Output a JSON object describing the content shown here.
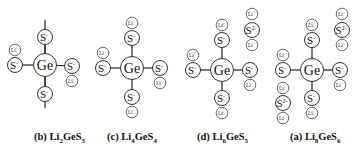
{
  "figure": {
    "panels": [
      {
        "id": "b",
        "caption_prefix": "(b) ",
        "formula": [
          {
            "t": "Li"
          },
          {
            "sub": "2"
          },
          {
            "t": "GeS"
          },
          {
            "sub": "3"
          }
        ],
        "center": {
          "label": "Ge",
          "x": 45,
          "y": 65
        },
        "bonds": [
          [
            45,
            20,
            45,
            108
          ]
        ],
        "atoms": [
          {
            "type": "S",
            "label": "S",
            "charge": "-",
            "x": 45,
            "y": 37
          },
          {
            "type": "S",
            "label": "S",
            "charge": "-",
            "x": 15,
            "y": 65
          },
          {
            "type": "Li",
            "label": "Li",
            "charge": "+",
            "x": 15,
            "y": 50
          },
          {
            "type": "S",
            "label": "S",
            "charge": "-",
            "x": 72,
            "y": 66
          },
          {
            "type": "Li",
            "label": "Li",
            "charge": "+",
            "x": 72,
            "y": 81
          },
          {
            "type": "S",
            "label": "S",
            "charge": "-",
            "x": 45,
            "y": 94
          }
        ]
      },
      {
        "id": "c",
        "caption_prefix": "(c) ",
        "formula": [
          {
            "t": "Li"
          },
          {
            "sub": "4"
          },
          {
            "t": "GeS"
          },
          {
            "sub": "4"
          }
        ],
        "center": {
          "label": "Ge",
          "x": 132,
          "y": 68
        },
        "atoms": [
          {
            "type": "Li",
            "label": "Li",
            "charge": "+",
            "x": 132,
            "y": 23
          },
          {
            "type": "S",
            "label": "S",
            "charge": "-",
            "x": 132,
            "y": 38
          },
          {
            "type": "Li",
            "label": "Li",
            "charge": "+",
            "x": 103,
            "y": 53
          },
          {
            "type": "S",
            "label": "S",
            "charge": "-",
            "x": 103,
            "y": 68
          },
          {
            "type": "S",
            "label": "S",
            "charge": "-",
            "x": 160,
            "y": 68
          },
          {
            "type": "Li",
            "label": "Li",
            "charge": "+",
            "x": 160,
            "y": 83
          },
          {
            "type": "S",
            "label": "S",
            "charge": "-",
            "x": 132,
            "y": 97
          },
          {
            "type": "Li",
            "label": "Li",
            "charge": "+",
            "x": 132,
            "y": 112
          }
        ]
      },
      {
        "id": "d",
        "caption_prefix": "(d) ",
        "formula": [
          {
            "t": "Li"
          },
          {
            "sub": "6"
          },
          {
            "t": "GeS"
          },
          {
            "sub": "5"
          }
        ],
        "center": {
          "label": "Ge",
          "x": 222,
          "y": 70
        },
        "atoms": [
          {
            "type": "Li",
            "label": "Li",
            "charge": "+",
            "x": 222,
            "y": 25
          },
          {
            "type": "S",
            "label": "S",
            "charge": "-",
            "x": 222,
            "y": 40
          },
          {
            "type": "Li",
            "label": "Li",
            "charge": "+",
            "x": 193,
            "y": 55
          },
          {
            "type": "S",
            "label": "S",
            "charge": "-",
            "x": 193,
            "y": 70
          },
          {
            "type": "S",
            "label": "S",
            "charge": "-",
            "x": 250,
            "y": 70
          },
          {
            "type": "Li",
            "label": "Li",
            "charge": "+",
            "x": 250,
            "y": 85
          },
          {
            "type": "S",
            "label": "S",
            "charge": "-",
            "x": 222,
            "y": 98
          },
          {
            "type": "Li",
            "label": "Li",
            "charge": "+",
            "x": 222,
            "y": 113
          },
          {
            "type": "Li",
            "label": "Li",
            "charge": "+",
            "x": 252,
            "y": 14
          },
          {
            "type": "S",
            "label": "S",
            "charge": "2-",
            "x": 252,
            "y": 30
          },
          {
            "type": "Li",
            "label": "Li",
            "charge": "+",
            "x": 252,
            "y": 45
          }
        ]
      },
      {
        "id": "a",
        "caption_prefix": "(a) ",
        "formula": [
          {
            "t": "Li"
          },
          {
            "sub": "8"
          },
          {
            "t": "GeS"
          },
          {
            "sub": "6"
          }
        ],
        "center": {
          "label": "Ge",
          "x": 312,
          "y": 70
        },
        "atoms": [
          {
            "type": "Li",
            "label": "Li",
            "charge": "+",
            "x": 312,
            "y": 25
          },
          {
            "type": "S",
            "label": "S",
            "charge": "-",
            "x": 312,
            "y": 40
          },
          {
            "type": "Li",
            "label": "Li",
            "charge": "+",
            "x": 283,
            "y": 55
          },
          {
            "type": "S",
            "label": "S",
            "charge": "-",
            "x": 283,
            "y": 70
          },
          {
            "type": "S",
            "label": "S",
            "charge": "-",
            "x": 340,
            "y": 70
          },
          {
            "type": "Li",
            "label": "Li",
            "charge": "+",
            "x": 340,
            "y": 85
          },
          {
            "type": "S",
            "label": "S",
            "charge": "-",
            "x": 312,
            "y": 98
          },
          {
            "type": "Li",
            "label": "Li",
            "charge": "+",
            "x": 312,
            "y": 113
          },
          {
            "type": "Li",
            "label": "Li",
            "charge": "+",
            "x": 342,
            "y": 14
          },
          {
            "type": "S",
            "label": "S",
            "charge": "2-",
            "x": 342,
            "y": 30
          },
          {
            "type": "Li",
            "label": "Li",
            "charge": "+",
            "x": 342,
            "y": 45
          },
          {
            "type": "Li",
            "label": "Li",
            "charge": "+",
            "x": 283,
            "y": 88
          },
          {
            "type": "S",
            "label": "S",
            "charge": "2-",
            "x": 283,
            "y": 103
          },
          {
            "type": "Li",
            "label": "Li",
            "charge": "+",
            "x": 283,
            "y": 118
          }
        ]
      }
    ],
    "captions": {
      "b": {
        "prefix": "(b) ",
        "a": "Li",
        "n1": "2",
        "b": "GeS",
        "n2": "3"
      },
      "c": {
        "prefix": "(c) ",
        "a": "Li",
        "n1": "4",
        "b": "GeS",
        "n2": "4"
      },
      "d": {
        "prefix": "(d) ",
        "a": "Li",
        "n1": "6",
        "b": "GeS",
        "n2": "5"
      },
      "a": {
        "prefix": "(a) ",
        "a": "Li",
        "n1": "8",
        "b": "GeS",
        "n2": "6"
      }
    }
  }
}
